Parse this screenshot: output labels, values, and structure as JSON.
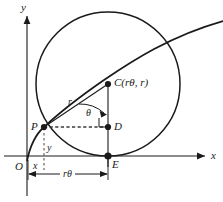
{
  "figure": {
    "type": "geometry-diagram",
    "axes": {
      "x_label": "x",
      "y_label": "y",
      "origin_label": "O"
    },
    "points": [
      {
        "id": "P",
        "label": "P",
        "x": 44,
        "y": 127
      },
      {
        "id": "C",
        "label": "C(rθ, r)",
        "x": 108,
        "y": 84
      },
      {
        "id": "D",
        "label": "D",
        "x": 108,
        "y": 127
      },
      {
        "id": "E",
        "label": "E",
        "x": 108,
        "y": 156
      }
    ],
    "measures": {
      "radius_label": "r",
      "angle_label": "θ",
      "height_label": "y",
      "offset_label": "x",
      "arc_label": "rθ"
    },
    "colors": {
      "stroke": "#1a1a1a",
      "background": "#ffffff",
      "dashed": "#4d4d4d"
    }
  }
}
